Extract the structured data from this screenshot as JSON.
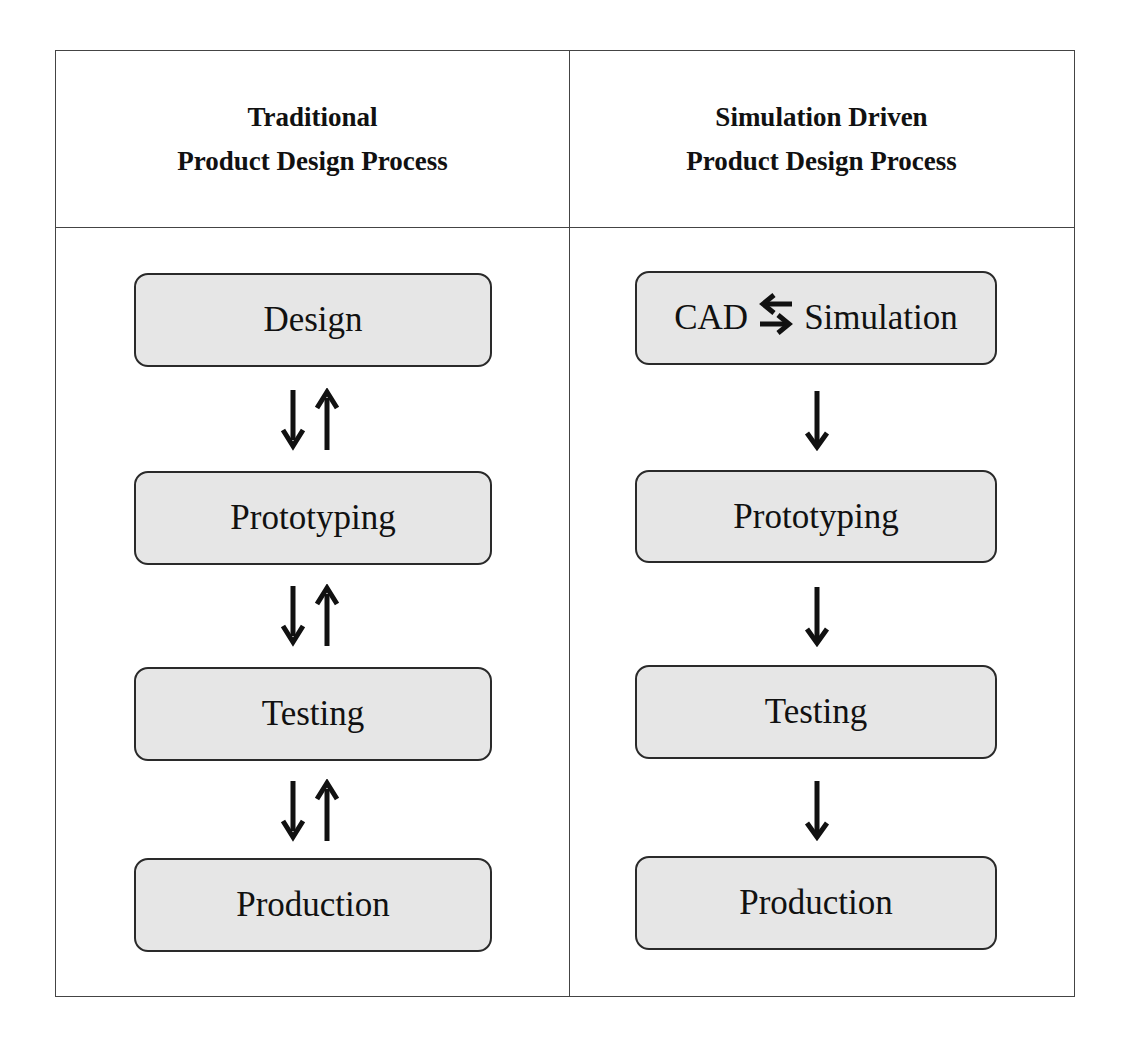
{
  "diagram": {
    "type": "process-comparison-table",
    "columns": [
      {
        "title_line1": "Traditional",
        "title_line2": "Product Design Process",
        "steps": [
          "Design",
          "Prototyping",
          "Testing",
          "Production"
        ],
        "connectors": [
          "bidirectional",
          "bidirectional",
          "bidirectional"
        ]
      },
      {
        "title_line1": "Simulation Driven",
        "title_line2": "Product Design Process",
        "first_step": {
          "left": "CAD",
          "right": "Simulation",
          "connector": "bidirectional-horizontal"
        },
        "steps": [
          "CAD ⇄ Simulation",
          "Prototyping",
          "Testing",
          "Production"
        ],
        "step_labels": [
          "",
          "Prototyping",
          "Testing",
          "Production"
        ],
        "connectors": [
          "down",
          "down",
          "down"
        ]
      }
    ],
    "colors": {
      "box_fill": "#e6e6e6",
      "box_border": "#2a2a2a",
      "grid_line": "#444444",
      "text": "#111111"
    }
  }
}
